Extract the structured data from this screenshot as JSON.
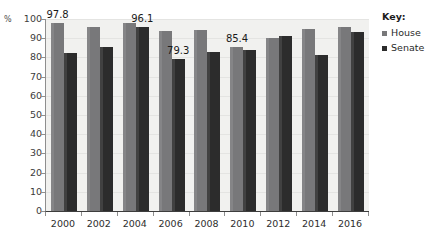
{
  "axis": {
    "unit_label": "%",
    "y_ticks": [
      "100",
      "90",
      "80",
      "70",
      "60",
      "50",
      "40",
      "30",
      "20",
      "10",
      "0"
    ],
    "x_labels": [
      "2000",
      "2002",
      "2004",
      "2006",
      "2008",
      "2010",
      "2012",
      "2014",
      "2016"
    ]
  },
  "legend": {
    "title": "Key:",
    "entries": [
      {
        "label": "House",
        "color": "#78787a",
        "icon": "square-swatch-icon"
      },
      {
        "label": "Senate",
        "color": "#2c2c2c",
        "icon": "square-swatch-icon"
      }
    ]
  },
  "annotations": [
    {
      "text": "97.8",
      "series": "House",
      "category": "2000"
    },
    {
      "text": "96.1",
      "series": "Senate",
      "category": "2004"
    },
    {
      "text": "79.3",
      "series": "Senate",
      "category": "2006"
    },
    {
      "text": "85.4",
      "series": "House",
      "category": "2010"
    }
  ],
  "chart_data": {
    "type": "bar",
    "title": "",
    "xlabel": "",
    "ylabel": "%",
    "ylim": [
      0,
      100
    ],
    "yticks": [
      0,
      10,
      20,
      30,
      40,
      50,
      60,
      70,
      80,
      90,
      100
    ],
    "grid": true,
    "legend_position": "right",
    "categories": [
      "2000",
      "2002",
      "2004",
      "2006",
      "2008",
      "2010",
      "2012",
      "2014",
      "2016"
    ],
    "series": [
      {
        "name": "House",
        "color": "#78787a",
        "values": [
          97.8,
          96.0,
          97.8,
          94.0,
          94.5,
          85.4,
          90.0,
          95.0,
          96.0
        ]
      },
      {
        "name": "Senate",
        "color": "#2c2c2c",
        "values": [
          82.5,
          85.5,
          96.1,
          79.3,
          83.0,
          84.0,
          91.0,
          81.0,
          93.0
        ]
      }
    ],
    "data_labels": [
      {
        "category": "2000",
        "series": "House",
        "value": 97.8
      },
      {
        "category": "2004",
        "series": "Senate",
        "value": 96.1
      },
      {
        "category": "2006",
        "series": "Senate",
        "value": 79.3
      },
      {
        "category": "2010",
        "series": "House",
        "value": 85.4
      }
    ]
  }
}
